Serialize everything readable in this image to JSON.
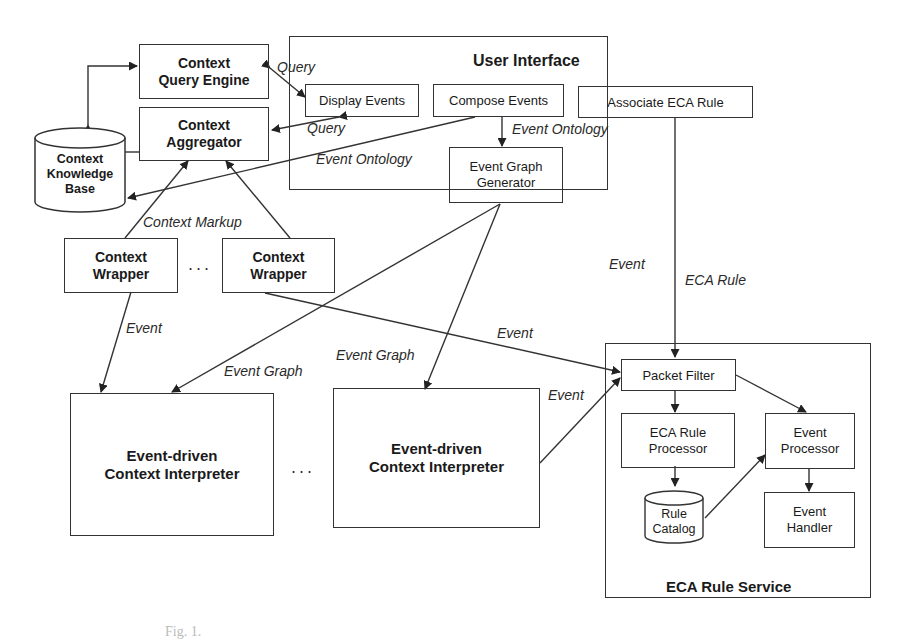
{
  "diagram": {
    "nodes": {
      "context_query_engine": "Context\nQuery Engine",
      "context_aggregator": "Context\nAggregator",
      "context_knowledge_base": "Context\nKnowledge\nBase",
      "context_wrapper_1": "Context\nWrapper",
      "context_wrapper_2": "Context\nWrapper",
      "user_interface_title": "User Interface",
      "display_events": "Display Events",
      "compose_events": "Compose Events",
      "associate_eca_rule": "Associate ECA Rule",
      "event_graph_generator": "Event Graph\nGenerator",
      "interpreter_1": "Event-driven\nContext Interpreter",
      "interpreter_2": "Event-driven\nContext Interpreter",
      "eca_rule_service_title": "ECA Rule Service",
      "packet_filter": "Packet Filter",
      "eca_rule_processor": "ECA Rule\nProcessor",
      "rule_catalog": "Rule\nCatalog",
      "event_processor": "Event\nProcessor",
      "event_handler": "Event\nHandler"
    },
    "edge_labels": {
      "query_1": "Query",
      "query_2": "Query",
      "event_ontology_1": "Event Ontology",
      "event_ontology_2": "Event Ontology",
      "context_markup": "Context Markup",
      "event_wrapper": "Event",
      "event_graph_1": "Event Graph",
      "event_graph_2": "Event Graph",
      "event_to_filter": "Event",
      "event_vertical": "Event",
      "eca_rule": "ECA Rule",
      "event_interp": "Event"
    },
    "ellipsis_wrappers": "...",
    "ellipsis_interpreters": "...",
    "caption": "Fig. 1."
  }
}
